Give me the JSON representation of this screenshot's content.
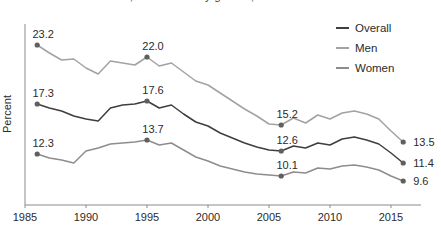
{
  "clipped_title": "…, overall and by gender, 1985–2017",
  "colors": {
    "axis": "#8a8a8a",
    "text": "#2b2b2b",
    "marker": "#5f5f5f",
    "overall": "#3e3e3e",
    "men": "#a2a2a2",
    "women": "#8d8d8d"
  },
  "chart_data": {
    "type": "line",
    "xlabel": "",
    "ylabel": "Percent",
    "ylim": [
      7.2,
      25.3
    ],
    "grid": false,
    "legend_position": "top-right",
    "x_ticks": [
      1985,
      1990,
      1995,
      2000,
      2005,
      2010,
      2015
    ],
    "year_start": 1986,
    "year_end": 2016,
    "series": [
      {
        "name": "Overall",
        "color_key": "overall",
        "values": [
          17.3,
          16.9,
          16.6,
          16.1,
          15.8,
          15.6,
          16.9,
          17.2,
          17.3,
          17.6,
          16.9,
          17.2,
          16.3,
          15.5,
          15.1,
          14.4,
          13.9,
          13.4,
          13.0,
          12.7,
          12.6,
          13.1,
          12.9,
          13.4,
          13.2,
          13.8,
          14.0,
          13.7,
          13.3,
          12.4,
          11.4
        ]
      },
      {
        "name": "Men",
        "color_key": "men",
        "values": [
          23.2,
          22.4,
          21.7,
          21.8,
          20.9,
          20.3,
          21.6,
          21.4,
          21.2,
          22.0,
          21.1,
          21.4,
          20.5,
          19.6,
          19.2,
          18.4,
          17.6,
          16.8,
          16.1,
          15.3,
          15.2,
          15.9,
          15.4,
          16.2,
          15.8,
          16.4,
          16.6,
          16.3,
          15.8,
          14.6,
          13.5
        ]
      },
      {
        "name": "Women",
        "color_key": "women",
        "values": [
          12.3,
          11.9,
          11.7,
          11.4,
          12.6,
          12.9,
          13.3,
          13.4,
          13.5,
          13.7,
          13.2,
          13.4,
          12.7,
          12.0,
          11.6,
          11.1,
          10.8,
          10.5,
          10.3,
          10.2,
          10.1,
          10.5,
          10.4,
          10.9,
          10.8,
          11.1,
          11.2,
          11.0,
          10.7,
          10.1,
          9.6
        ]
      }
    ],
    "labeled_points": [
      {
        "series": "Men",
        "year": 1986,
        "value": 23.2,
        "label": "23.2",
        "placement": "above"
      },
      {
        "series": "Men",
        "year": 1995,
        "value": 22.0,
        "label": "22.0",
        "placement": "above"
      },
      {
        "series": "Men",
        "year": 2006,
        "value": 15.2,
        "label": "15.2",
        "placement": "above"
      },
      {
        "series": "Men",
        "year": 2016,
        "value": 13.5,
        "label": "13.5",
        "placement": "right"
      },
      {
        "series": "Overall",
        "year": 1986,
        "value": 17.3,
        "label": "17.3",
        "placement": "above"
      },
      {
        "series": "Overall",
        "year": 1995,
        "value": 17.6,
        "label": "17.6",
        "placement": "above"
      },
      {
        "series": "Overall",
        "year": 2006,
        "value": 12.6,
        "label": "12.6",
        "placement": "above"
      },
      {
        "series": "Overall",
        "year": 2016,
        "value": 11.4,
        "label": "11.4",
        "placement": "right"
      },
      {
        "series": "Women",
        "year": 1986,
        "value": 12.3,
        "label": "12.3",
        "placement": "above"
      },
      {
        "series": "Women",
        "year": 1995,
        "value": 13.7,
        "label": "13.7",
        "placement": "above"
      },
      {
        "series": "Women",
        "year": 2006,
        "value": 10.1,
        "label": "10.1",
        "placement": "above"
      },
      {
        "series": "Women",
        "year": 2016,
        "value": 9.6,
        "label": "9.6",
        "placement": "right"
      }
    ],
    "legend": [
      "Overall",
      "Men",
      "Women"
    ]
  }
}
